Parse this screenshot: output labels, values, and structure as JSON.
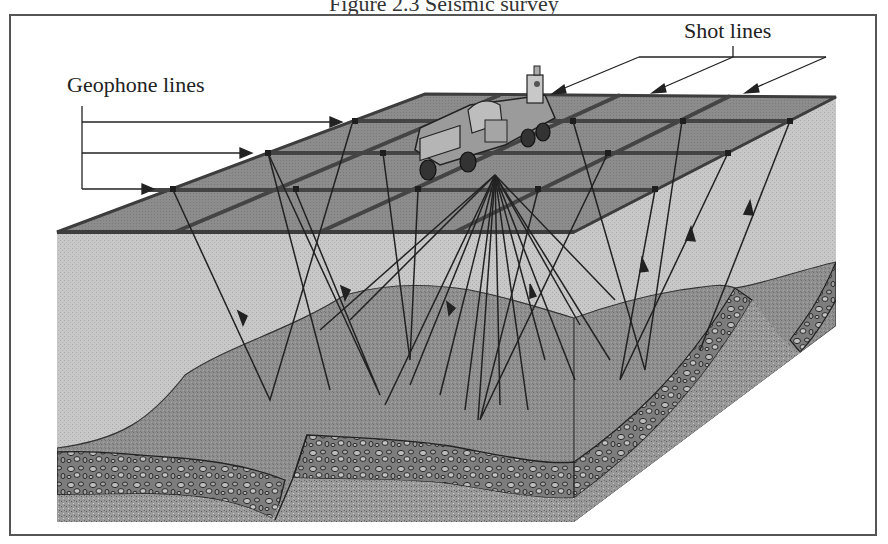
{
  "figure": {
    "caption_partial": "Figure 2.3 Seismic survey",
    "type": "3D block diagram of a seismic reflection survey"
  },
  "labels": {
    "geophone_lines": "Geophone lines",
    "shot_lines": "Shot lines"
  },
  "components": {
    "vehicle": "vibroseis truck (seismic source)",
    "surface_grid": "geophone and shot line grid",
    "rays": "reflected seismic ray paths with upward arrows",
    "layers": [
      "near-surface layer",
      "folded sedimentary layer",
      "conglomerate bed",
      "basement layer"
    ]
  },
  "colors": {
    "surface_top": "#8a8a8a",
    "grid_line": "#444444",
    "upper_layer": "#c9c9c9",
    "middle_layer": "#8e8e8e",
    "conglomerate": "#7a7a7a",
    "basement": "#9a9a9a",
    "ray": "#222222"
  }
}
